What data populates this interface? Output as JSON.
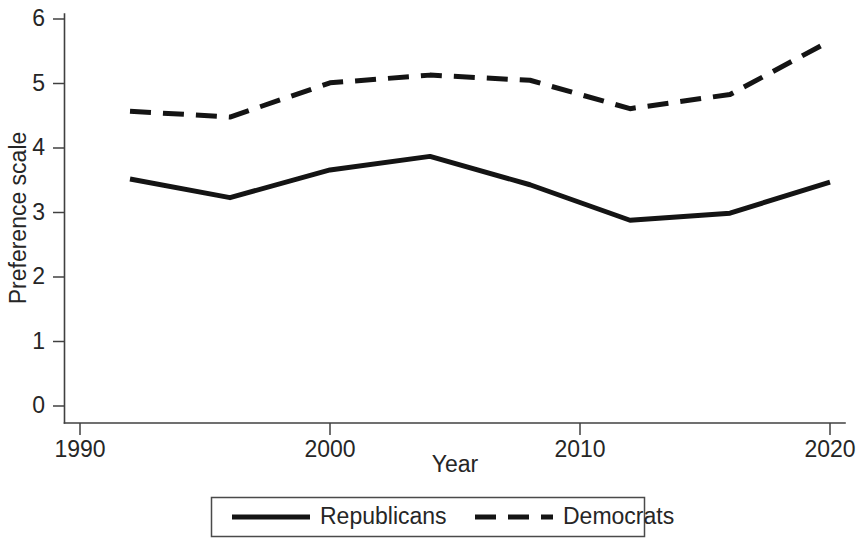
{
  "chart_data": {
    "type": "line",
    "title": "",
    "subtitle": "",
    "xlabel": "Year",
    "ylabel": "Preference scale",
    "xlim": [
      1990,
      2021
    ],
    "ylim": [
      0,
      6.3
    ],
    "xticks": [
      1990,
      2000,
      2010,
      2020
    ],
    "xtick_labels": [
      "1990",
      "2000",
      "2010",
      "2020"
    ],
    "yticks": [
      0,
      1,
      2,
      3,
      4,
      5,
      6
    ],
    "ytick_labels": [
      "0",
      "1",
      "2",
      "3",
      "4",
      "5",
      "6"
    ],
    "grid": false,
    "legend_position": "bottom-outside",
    "x": [
      1992,
      1996,
      2000,
      2004,
      2008,
      2012,
      2016,
      2020
    ],
    "series": [
      {
        "name": "Republicans",
        "style": "solid",
        "color": "#141414",
        "values": [
          3.52,
          3.23,
          3.66,
          3.87,
          3.43,
          2.88,
          2.99,
          3.47
        ]
      },
      {
        "name": "Democrats",
        "style": "dashed",
        "color": "#141414",
        "values": [
          4.57,
          4.48,
          5.01,
          5.13,
          5.05,
          4.61,
          4.83,
          5.66
        ]
      }
    ]
  },
  "legend": {
    "entries": [
      {
        "label": "Republicans",
        "style": "solid"
      },
      {
        "label": "Democrats",
        "style": "dashed"
      }
    ]
  }
}
